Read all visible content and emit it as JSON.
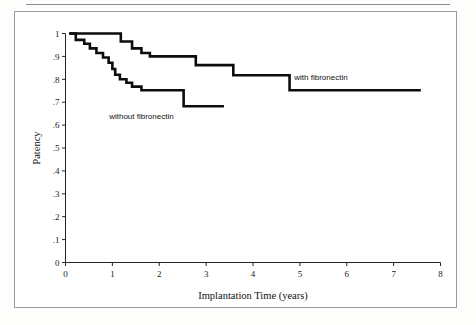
{
  "figure": {
    "background_color": "#ffffff",
    "border_color": "#9a9a9a",
    "rule_color": "#8d8d8d"
  },
  "chart_data": {
    "type": "line",
    "subtype": "kaplan-meier-step",
    "title": "",
    "subtitle": "",
    "xlabel": "Implantation Time (years)",
    "ylabel": "Patency",
    "xlim": [
      0,
      8
    ],
    "ylim": [
      0,
      1
    ],
    "grid": false,
    "legend_position": "inline-annotations",
    "line_color": "#0d0d0d",
    "xticks": [
      0,
      1,
      2,
      3,
      4,
      5,
      6,
      7,
      8
    ],
    "xtick_labels": [
      "0",
      "1",
      "2",
      "3",
      "4",
      "5",
      "6",
      "7",
      "8"
    ],
    "yticks": [
      0,
      0.1,
      0.2,
      0.3,
      0.4,
      0.5,
      0.6,
      0.7,
      0.8,
      0.9,
      1
    ],
    "ytick_labels": [
      "0",
      ".1",
      ".2",
      ".3",
      ".4",
      ".5",
      ".6",
      ".7",
      ".8",
      ".9",
      "1"
    ],
    "series": [
      {
        "name": "with fibronectin",
        "annotation": "with  fibronectin",
        "annotation_x": 5.45,
        "annotation_y": 0.795,
        "x": [
          0.08,
          1.18,
          1.18,
          1.42,
          1.42,
          1.62,
          1.62,
          1.8,
          1.8,
          2.78,
          2.78,
          3.58,
          3.58,
          4.78,
          4.78,
          7.58
        ],
        "y": [
          1.0,
          1.0,
          0.965,
          0.965,
          0.935,
          0.935,
          0.915,
          0.915,
          0.9,
          0.9,
          0.862,
          0.862,
          0.818,
          0.818,
          0.752,
          0.752
        ]
      },
      {
        "name": "without fibronectin",
        "annotation": "without  fibronectin",
        "annotation_x": 1.62,
        "annotation_y": 0.627,
        "x": [
          0.08,
          0.22,
          0.22,
          0.4,
          0.4,
          0.52,
          0.52,
          0.66,
          0.66,
          0.8,
          0.8,
          0.92,
          0.92,
          1.0,
          1.0,
          1.06,
          1.06,
          1.16,
          1.16,
          1.3,
          1.3,
          1.42,
          1.42,
          1.62,
          1.62,
          2.52,
          2.52,
          3.38
        ],
        "y": [
          1.0,
          1.0,
          0.972,
          0.972,
          0.955,
          0.955,
          0.935,
          0.935,
          0.915,
          0.915,
          0.895,
          0.895,
          0.872,
          0.872,
          0.845,
          0.845,
          0.82,
          0.82,
          0.8,
          0.8,
          0.785,
          0.785,
          0.768,
          0.768,
          0.752,
          0.752,
          0.682,
          0.682
        ]
      }
    ]
  }
}
